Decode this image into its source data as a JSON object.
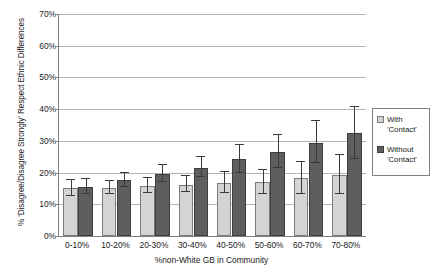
{
  "chart_data": {
    "type": "bar",
    "title": "",
    "xlabel": "%non-White GB in Community",
    "ylabel": "% 'Disagree/Disagree Strongly' Respect Ethnic Differences",
    "categories": [
      "0-10%",
      "10-20%",
      "20-30%",
      "30-40%",
      "40-50%",
      "50-60%",
      "60-70%",
      "70-80%"
    ],
    "ylim": [
      0,
      70
    ],
    "ytick_labels": [
      "0%",
      "10%",
      "20%",
      "30%",
      "40%",
      "50%",
      "60%",
      "70%"
    ],
    "ytick_values": [
      0,
      10,
      20,
      30,
      40,
      50,
      60,
      70
    ],
    "grid": true,
    "legend_position": "right",
    "series": [
      {
        "name": "With 'Contact'",
        "color": "#d4d4d4",
        "values": [
          15.0,
          15.2,
          15.8,
          16.2,
          16.8,
          17.0,
          18.2,
          19.2
        ],
        "err_low": [
          12.6,
          13.2,
          13.6,
          13.8,
          13.6,
          13.2,
          13.4,
          13.4
        ],
        "err_high": [
          17.6,
          17.4,
          18.2,
          18.8,
          20.2,
          20.8,
          23.2,
          25.4
        ]
      },
      {
        "name": "Without 'Contact'",
        "color": "#5e5e5e",
        "values": [
          15.6,
          17.6,
          19.6,
          21.6,
          24.2,
          26.6,
          29.4,
          32.4
        ],
        "err_low": [
          13.4,
          15.4,
          17.0,
          18.6,
          20.0,
          21.6,
          23.0,
          24.4
        ],
        "err_high": [
          18.0,
          19.8,
          22.4,
          24.8,
          28.6,
          31.8,
          36.2,
          40.6
        ]
      }
    ]
  },
  "legend": {
    "items": [
      {
        "label": "With\n'Contact'",
        "swatch": "light"
      },
      {
        "label": "Without\n'Contact'",
        "swatch": "dark"
      }
    ]
  }
}
